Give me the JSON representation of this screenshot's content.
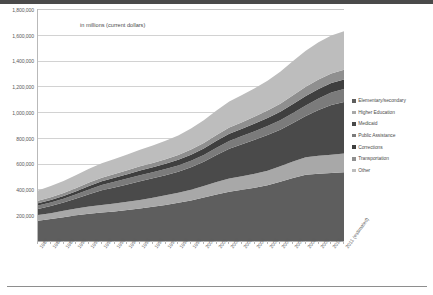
{
  "subtitle": "in millions (current dollars)",
  "legend": {
    "position": "right",
    "items": [
      {
        "label": "Elementary/secondary",
        "color": "#5e5e5e"
      },
      {
        "label": "Higher Education",
        "color": "#a8a8a8"
      },
      {
        "label": "Medicaid",
        "color": "#4a4a4a"
      },
      {
        "label": "Public Assistance",
        "color": "#7b7b7b"
      },
      {
        "label": "Corrections",
        "color": "#3f3f3f"
      },
      {
        "label": "Transportation",
        "color": "#8f8f8f"
      },
      {
        "label": "Other",
        "color": "#bdbdbd"
      }
    ]
  },
  "yaxis": {
    "ticks": [
      "1,800,000",
      "1,600,000",
      "1,400,000",
      "1,200,000",
      "1,000,000",
      "800,000",
      "600,000",
      "400,000",
      "200,000"
    ]
  },
  "chart_data": {
    "type": "area",
    "stacked": true,
    "title": "",
    "subtitle": "in millions (current dollars)",
    "xlabel": "",
    "ylabel": "",
    "ylim": [
      0,
      1800000
    ],
    "ytick_step": 200000,
    "grid": true,
    "legend_position": "right",
    "categories": [
      "1987",
      "1988",
      "1989",
      "1990",
      "1991",
      "1992",
      "1993",
      "1994",
      "1995",
      "1996",
      "1997",
      "1998",
      "1999",
      "2000",
      "2001",
      "2002",
      "2003",
      "2004",
      "2005",
      "2006",
      "2007",
      "2008",
      "2009",
      "2010",
      "2011 (estimated)"
    ],
    "series": [
      {
        "name": "Elementary/secondary",
        "values": [
          158000,
          170000,
          184000,
          199000,
          211000,
          221000,
          229000,
          240000,
          252000,
          265000,
          280000,
          296000,
          315000,
          337000,
          361000,
          383000,
          398000,
          413000,
          433000,
          459000,
          488000,
          514000,
          522000,
          528000,
          534000
        ]
      },
      {
        "name": "Higher Education",
        "values": [
          43000,
          46000,
          50000,
          54000,
          57000,
          59000,
          61000,
          64000,
          67000,
          70000,
          74000,
          78000,
          83000,
          89000,
          96000,
          101000,
          104000,
          108000,
          113000,
          120000,
          128000,
          135000,
          139000,
          142000,
          144000
        ]
      },
      {
        "name": "Medicaid",
        "values": [
          48000,
          55000,
          64000,
          76000,
          95000,
          113000,
          126000,
          134000,
          144000,
          151000,
          157000,
          164000,
          175000,
          189000,
          210000,
          231000,
          248000,
          264000,
          276000,
          285000,
          300000,
          321000,
          355000,
          385000,
          400000
        ]
      },
      {
        "name": "Public Assistance",
        "values": [
          26000,
          28000,
          30000,
          33000,
          37000,
          41000,
          44000,
          46000,
          47000,
          47000,
          47000,
          48000,
          50000,
          53000,
          57000,
          61000,
          64000,
          67000,
          70000,
          73000,
          77000,
          82000,
          90000,
          97000,
          101000
        ]
      },
      {
        "name": "Corrections",
        "values": [
          17000,
          19000,
          21000,
          24000,
          26000,
          29000,
          31000,
          34000,
          37000,
          39000,
          41000,
          44000,
          47000,
          50000,
          53000,
          56000,
          57000,
          59000,
          62000,
          66000,
          70000,
          73000,
          74000,
          74000,
          74000
        ]
      },
      {
        "name": "Transportation",
        "values": [
          20000,
          22000,
          24000,
          26000,
          27000,
          28000,
          29000,
          30000,
          32000,
          33000,
          35000,
          37000,
          40000,
          43000,
          46000,
          49000,
          51000,
          54000,
          58000,
          62000,
          67000,
          71000,
          73000,
          74000,
          75000
        ]
      },
      {
        "name": "Other",
        "values": [
          80000,
          86000,
          93000,
          101000,
          107000,
          112000,
          117000,
          123000,
          129000,
          135000,
          143000,
          152000,
          163000,
          176000,
          190000,
          202000,
          210000,
          220000,
          232000,
          248000,
          266000,
          281000,
          289000,
          295000,
          300000
        ]
      }
    ]
  }
}
